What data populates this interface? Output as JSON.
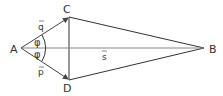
{
  "diagram": {
    "points": {
      "A": {
        "label": "A",
        "x": 21,
        "y": 48
      },
      "B": {
        "label": "B",
        "x": 204,
        "y": 48
      },
      "C": {
        "label": "C",
        "x": 69,
        "y": 17
      },
      "D": {
        "label": "D",
        "x": 69,
        "y": 80
      }
    },
    "vectors": {
      "q": {
        "label": "q",
        "from": "A",
        "to": "C"
      },
      "p": {
        "label": "p",
        "from": "A",
        "to": "D"
      },
      "s": {
        "label": "s",
        "from": "A",
        "to": "B"
      }
    },
    "angles": [
      {
        "label": "φ",
        "between": [
          "q",
          "s"
        ]
      },
      {
        "label": "φ",
        "between": [
          "s",
          "p"
        ]
      }
    ],
    "colors": {
      "line": "#333333",
      "vector": "#555555",
      "axis": "#888888"
    }
  }
}
